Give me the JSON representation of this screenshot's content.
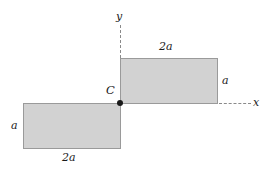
{
  "figure": {
    "type": "engineering-cross-section-diagram",
    "background_color": "#ffffff",
    "fill_color": "#d2d2d2",
    "stroke_color": "#9a9a9a",
    "axis_color": "#8a8a8a",
    "point_color": "#1a1a1a"
  },
  "axes": {
    "y_label": "y",
    "x_label": "x",
    "y_style": "dashed",
    "x_style": "dashed"
  },
  "centroid": {
    "label": "C"
  },
  "shapes": {
    "upper_rectangle": {
      "name": "upper-right-rectangle",
      "width_label": "2a",
      "height_label": "a"
    },
    "lower_rectangle": {
      "name": "lower-left-rectangle",
      "width_label": "2a",
      "height_label": "a"
    }
  }
}
